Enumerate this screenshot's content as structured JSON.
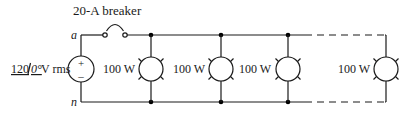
{
  "diagram": {
    "type": "circuit",
    "breaker": {
      "label": "20-A breaker"
    },
    "nodes": {
      "top": "a",
      "bottom": "n"
    },
    "source": {
      "magnitude": "120",
      "angle": "0°",
      "unit": "V rms",
      "plus": "+",
      "minus": "–"
    },
    "lamps": [
      {
        "label": "100 W"
      },
      {
        "label": "100 W"
      },
      {
        "label": "100 W"
      },
      {
        "label": "100 W"
      }
    ]
  }
}
